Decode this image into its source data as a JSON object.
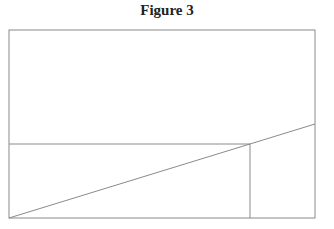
{
  "figure": {
    "title": "Figure 3",
    "stroke_color": "#8a8a8a",
    "frame": {
      "x1": 9,
      "y1": 30,
      "x2": 315,
      "y2": 218
    },
    "lines": [
      {
        "name": "horizontal-line",
        "x1": 9,
        "y1": 144,
        "x2": 250,
        "y2": 144
      },
      {
        "name": "vertical-line",
        "x1": 250,
        "y1": 144,
        "x2": 250,
        "y2": 218
      },
      {
        "name": "diagonal-line",
        "x1": 9,
        "y1": 218,
        "x2": 315,
        "y2": 124
      }
    ]
  }
}
